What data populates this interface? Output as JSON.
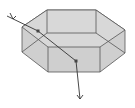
{
  "diagram": {
    "colors": {
      "face_fill": "#cfcfcf",
      "edge": "#555555",
      "ray": "#333333",
      "background": "#ffffff"
    },
    "elements": [
      {
        "id": "hexagonal-prism",
        "label": ""
      },
      {
        "id": "incident-ray",
        "label": ""
      },
      {
        "id": "internal-ray",
        "label": ""
      },
      {
        "id": "exit-ray",
        "label": ""
      }
    ],
    "caption": ""
  }
}
